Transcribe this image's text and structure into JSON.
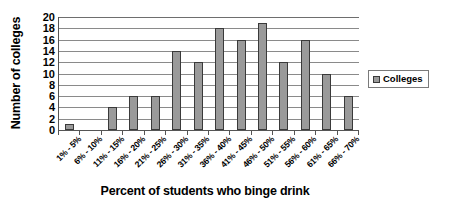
{
  "chart_data": {
    "type": "bar",
    "title": "",
    "xlabel": "Percent of students who binge drink",
    "ylabel": "Number of colleges",
    "ylim": [
      0,
      20
    ],
    "ytick_step": 2,
    "yticks": [
      0,
      2,
      4,
      6,
      8,
      10,
      12,
      14,
      16,
      18,
      20
    ],
    "grid": true,
    "legend_position": "right",
    "categories": [
      "1% - 5%",
      "6% - 10%",
      "11% - 15%",
      "16% - 20%",
      "21% - 25%",
      "26% - 30%",
      "31% - 35%",
      "36% - 40%",
      "41% - 45%",
      "46% - 50%",
      "51% - 55%",
      "56% - 60%",
      "61% - 65%",
      "66% - 70%"
    ],
    "series": [
      {
        "name": "Colleges",
        "color": "#9a9a9a",
        "values": [
          1,
          0,
          4,
          6,
          6,
          14,
          12,
          18,
          16,
          19,
          12,
          16,
          10,
          6
        ]
      }
    ]
  },
  "legend": {
    "entries": [
      {
        "label": "Colleges",
        "color": "#9a9a9a"
      }
    ]
  }
}
